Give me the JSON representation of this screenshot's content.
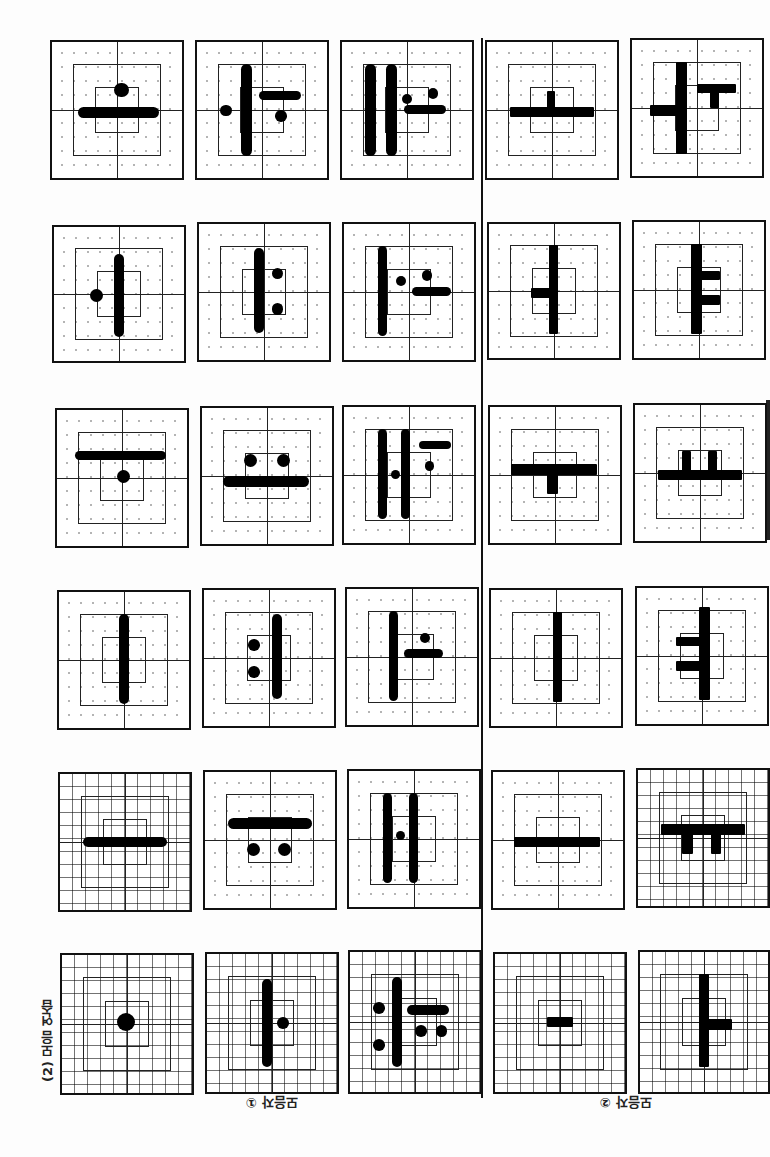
{
  "page": {
    "orientation": "upside-down scan",
    "section_label": "(2) 모음 연습",
    "group_labels": [
      "모음자 ①",
      "모음자 ②"
    ]
  },
  "cells": [
    {
      "id": "r1c1",
      "x": 50,
      "y": 40,
      "w": 134,
      "h": 140,
      "grid": "dotted",
      "glyph": "ㅗ (inverted)",
      "shapes": [
        {
          "t": "bar",
          "x": 20,
          "y": 48,
          "w": 62,
          "h": 8
        },
        {
          "t": "dot",
          "x": 48,
          "y": 30,
          "d": 11
        }
      ]
    },
    {
      "id": "r1c2",
      "x": 195,
      "y": 40,
      "w": 134,
      "h": 140,
      "grid": "dotted",
      "glyph": "ㅕ (inverted)",
      "shapes": [
        {
          "t": "bar",
          "x": 34,
          "y": 16,
          "w": 8,
          "h": 68
        },
        {
          "t": "bar",
          "x": 48,
          "y": 36,
          "w": 32,
          "h": 7
        },
        {
          "t": "dot",
          "x": 18,
          "y": 46,
          "d": 9
        },
        {
          "t": "dot",
          "x": 60,
          "y": 50,
          "d": 9
        }
      ]
    },
    {
      "id": "r1c3",
      "x": 340,
      "y": 40,
      "w": 134,
      "h": 140,
      "grid": "dotted",
      "glyph": "ㅒ (inverted)",
      "shapes": [
        {
          "t": "bar",
          "x": 18,
          "y": 16,
          "w": 8,
          "h": 68
        },
        {
          "t": "bar",
          "x": 34,
          "y": 16,
          "w": 8,
          "h": 68
        },
        {
          "t": "bar",
          "x": 48,
          "y": 46,
          "w": 32,
          "h": 7
        },
        {
          "t": "dot",
          "x": 46,
          "y": 38,
          "d": 8
        },
        {
          "t": "dot",
          "x": 66,
          "y": 34,
          "d": 8
        }
      ]
    },
    {
      "id": "r1c4",
      "x": 485,
      "y": 40,
      "w": 134,
      "h": 140,
      "grid": "dotted",
      "glyph": "ㅗ (print, inverted)",
      "shapes": [
        {
          "t": "sq",
          "x": 18,
          "y": 48,
          "w": 64,
          "h": 7
        },
        {
          "t": "sq",
          "x": 46,
          "y": 36,
          "w": 6,
          "h": 14
        }
      ]
    },
    {
      "id": "r1c5",
      "x": 630,
      "y": 38,
      "w": 134,
      "h": 140,
      "grid": "dotted",
      "glyph": "ㅝ (print, inverted)",
      "shapes": [
        {
          "t": "sq",
          "x": 34,
          "y": 16,
          "w": 8,
          "h": 68
        },
        {
          "t": "sq",
          "x": 14,
          "y": 48,
          "w": 22,
          "h": 8
        },
        {
          "t": "sq",
          "x": 50,
          "y": 32,
          "w": 30,
          "h": 7
        },
        {
          "t": "sq",
          "x": 60,
          "y": 36,
          "w": 7,
          "h": 14
        }
      ]
    },
    {
      "id": "r2c1",
      "x": 52,
      "y": 225,
      "w": 134,
      "h": 138,
      "grid": "dotted",
      "glyph": "ㅓ (inverted)",
      "shapes": [
        {
          "t": "bar",
          "x": 46,
          "y": 20,
          "w": 8,
          "h": 62
        },
        {
          "t": "dot",
          "x": 28,
          "y": 46,
          "d": 10
        }
      ]
    },
    {
      "id": "r2c2",
      "x": 197,
      "y": 222,
      "w": 134,
      "h": 140,
      "grid": "dotted",
      "glyph": "ㅕ (inverted)",
      "shapes": [
        {
          "t": "bar",
          "x": 42,
          "y": 18,
          "w": 8,
          "h": 62
        },
        {
          "t": "dot",
          "x": 56,
          "y": 32,
          "d": 9
        },
        {
          "t": "dot",
          "x": 56,
          "y": 58,
          "d": 9
        }
      ]
    },
    {
      "id": "r2c3",
      "x": 342,
      "y": 222,
      "w": 134,
      "h": 140,
      "grid": "dotted",
      "glyph": "ㅓ+ㅗ (inverted)",
      "shapes": [
        {
          "t": "bar",
          "x": 26,
          "y": 16,
          "w": 7,
          "h": 66
        },
        {
          "t": "dot",
          "x": 40,
          "y": 38,
          "d": 8
        },
        {
          "t": "bar",
          "x": 52,
          "y": 46,
          "w": 30,
          "h": 7
        },
        {
          "t": "dot",
          "x": 60,
          "y": 34,
          "d": 8
        }
      ]
    },
    {
      "id": "r2c4",
      "x": 487,
      "y": 222,
      "w": 134,
      "h": 138,
      "grid": "dotted",
      "glyph": "ㅓ (print, inverted)",
      "shapes": [
        {
          "t": "sq",
          "x": 46,
          "y": 16,
          "w": 7,
          "h": 66
        },
        {
          "t": "sq",
          "x": 32,
          "y": 48,
          "w": 16,
          "h": 7
        }
      ]
    },
    {
      "id": "r2c5",
      "x": 632,
      "y": 220,
      "w": 134,
      "h": 140,
      "grid": "dotted",
      "glyph": "ㅕ (print, inverted)",
      "shapes": [
        {
          "t": "sq",
          "x": 44,
          "y": 16,
          "w": 8,
          "h": 66
        },
        {
          "t": "sq",
          "x": 50,
          "y": 36,
          "w": 16,
          "h": 7
        },
        {
          "t": "sq",
          "x": 50,
          "y": 54,
          "w": 16,
          "h": 7
        }
      ]
    },
    {
      "id": "r3c1",
      "x": 55,
      "y": 408,
      "w": 134,
      "h": 140,
      "grid": "dotted",
      "glyph": "ㅜ (inverted)",
      "shapes": [
        {
          "t": "bar",
          "x": 14,
          "y": 30,
          "w": 70,
          "h": 7
        },
        {
          "t": "dot",
          "x": 46,
          "y": 44,
          "d": 10
        }
      ]
    },
    {
      "id": "r3c2",
      "x": 200,
      "y": 406,
      "w": 134,
      "h": 140,
      "grid": "dotted",
      "glyph": "ㅠ (inverted)",
      "shapes": [
        {
          "t": "bar",
          "x": 16,
          "y": 50,
          "w": 66,
          "h": 8
        },
        {
          "t": "dot",
          "x": 32,
          "y": 34,
          "d": 10
        },
        {
          "t": "dot",
          "x": 58,
          "y": 34,
          "d": 10
        }
      ]
    },
    {
      "id": "r3c3",
      "x": 342,
      "y": 405,
      "w": 134,
      "h": 140,
      "grid": "dotted",
      "glyph": "ㅖ (inverted)",
      "shapes": [
        {
          "t": "bar",
          "x": 26,
          "y": 16,
          "w": 7,
          "h": 66
        },
        {
          "t": "bar",
          "x": 44,
          "y": 16,
          "w": 7,
          "h": 66
        },
        {
          "t": "bar",
          "x": 58,
          "y": 25,
          "w": 24,
          "h": 6
        },
        {
          "t": "dot",
          "x": 36,
          "y": 46,
          "d": 7
        },
        {
          "t": "dot",
          "x": 62,
          "y": 40,
          "d": 7
        }
      ]
    },
    {
      "id": "r3c4",
      "x": 488,
      "y": 405,
      "w": 134,
      "h": 140,
      "grid": "dotted",
      "glyph": "ㅜ (print, inverted)",
      "shapes": [
        {
          "t": "sq",
          "x": 16,
          "y": 42,
          "w": 66,
          "h": 8
        },
        {
          "t": "sq",
          "x": 44,
          "y": 48,
          "w": 8,
          "h": 16
        }
      ]
    },
    {
      "id": "r3c5",
      "x": 633,
      "y": 403,
      "w": 134,
      "h": 140,
      "grid": "dotted",
      "glyph": "ㅛ (print, inverted)",
      "shapes": [
        {
          "t": "sq",
          "x": 18,
          "y": 48,
          "w": 64,
          "h": 7
        },
        {
          "t": "sq",
          "x": 36,
          "y": 34,
          "w": 7,
          "h": 16
        },
        {
          "t": "sq",
          "x": 56,
          "y": 34,
          "w": 7,
          "h": 16
        }
      ]
    },
    {
      "id": "r4c1",
      "x": 57,
      "y": 590,
      "w": 134,
      "h": 140,
      "grid": "dotted",
      "glyph": "ㅣ (inverted)",
      "shapes": [
        {
          "t": "bar",
          "x": 46,
          "y": 16,
          "w": 8,
          "h": 66
        }
      ]
    },
    {
      "id": "r4c2",
      "x": 202,
      "y": 588,
      "w": 134,
      "h": 140,
      "grid": "dotted",
      "glyph": "ㅕ (inverted)",
      "shapes": [
        {
          "t": "bar",
          "x": 52,
          "y": 18,
          "w": 8,
          "h": 62
        },
        {
          "t": "dot",
          "x": 34,
          "y": 36,
          "d": 9
        },
        {
          "t": "dot",
          "x": 34,
          "y": 56,
          "d": 9
        }
      ]
    },
    {
      "id": "r4c3",
      "x": 345,
      "y": 587,
      "w": 134,
      "h": 140,
      "grid": "dotted",
      "glyph": "ㅛ/ㅓ (inverted)",
      "shapes": [
        {
          "t": "bar",
          "x": 32,
          "y": 16,
          "w": 7,
          "h": 66
        },
        {
          "t": "bar",
          "x": 44,
          "y": 44,
          "w": 30,
          "h": 7
        },
        {
          "t": "dot",
          "x": 56,
          "y": 32,
          "d": 8
        }
      ]
    },
    {
      "id": "r4c4",
      "x": 489,
      "y": 588,
      "w": 134,
      "h": 140,
      "grid": "dotted",
      "glyph": "ㅣ (print, inverted)",
      "shapes": [
        {
          "t": "sq",
          "x": 48,
          "y": 16,
          "w": 7,
          "h": 66
        }
      ]
    },
    {
      "id": "r4c5",
      "x": 635,
      "y": 586,
      "w": 134,
      "h": 140,
      "grid": "dotted",
      "glyph": "ㅕ (print, inverted)",
      "shapes": [
        {
          "t": "sq",
          "x": 48,
          "y": 14,
          "w": 8,
          "h": 68
        },
        {
          "t": "sq",
          "x": 30,
          "y": 36,
          "w": 20,
          "h": 7
        },
        {
          "t": "sq",
          "x": 30,
          "y": 54,
          "w": 20,
          "h": 7
        }
      ]
    },
    {
      "id": "r5c1",
      "x": 58,
      "y": 772,
      "w": 134,
      "h": 140,
      "grid": "fine",
      "glyph": "ㅡ (inverted)",
      "shapes": [
        {
          "t": "bar",
          "x": 18,
          "y": 46,
          "w": 64,
          "h": 8
        }
      ]
    },
    {
      "id": "r5c2",
      "x": 203,
      "y": 770,
      "w": 134,
      "h": 140,
      "grid": "dotted",
      "glyph": "ㅠ (inverted)",
      "shapes": [
        {
          "t": "bar",
          "x": 18,
          "y": 34,
          "w": 64,
          "h": 8
        },
        {
          "t": "dot",
          "x": 32,
          "y": 52,
          "d": 10
        },
        {
          "t": "dot",
          "x": 56,
          "y": 52,
          "d": 10
        }
      ]
    },
    {
      "id": "r5c3",
      "x": 347,
      "y": 769,
      "w": 134,
      "h": 140,
      "grid": "dotted",
      "glyph": "ㅒ (inverted)",
      "shapes": [
        {
          "t": "bar",
          "x": 26,
          "y": 16,
          "w": 7,
          "h": 66
        },
        {
          "t": "bar",
          "x": 46,
          "y": 16,
          "w": 7,
          "h": 66
        },
        {
          "t": "dot",
          "x": 36,
          "y": 44,
          "d": 7
        }
      ]
    },
    {
      "id": "r5c4",
      "x": 491,
      "y": 770,
      "w": 134,
      "h": 140,
      "grid": "dotted",
      "glyph": "ㅡ (print, inverted)",
      "shapes": [
        {
          "t": "sq",
          "x": 16,
          "y": 48,
          "w": 66,
          "h": 7
        }
      ]
    },
    {
      "id": "r5c5",
      "x": 636,
      "y": 768,
      "w": 134,
      "h": 140,
      "grid": "fine",
      "glyph": "ㅠ (print, inverted)",
      "shapes": [
        {
          "t": "sq",
          "x": 18,
          "y": 40,
          "w": 64,
          "h": 8
        },
        {
          "t": "sq",
          "x": 34,
          "y": 44,
          "w": 8,
          "h": 18
        },
        {
          "t": "sq",
          "x": 56,
          "y": 44,
          "w": 8,
          "h": 18
        }
      ]
    },
    {
      "id": "r6c1",
      "x": 60,
      "y": 953,
      "w": 134,
      "h": 142,
      "grid": "fine",
      "glyph": "· (dot)",
      "shapes": [
        {
          "t": "dot",
          "x": 42,
          "y": 42,
          "d": 14
        }
      ]
    },
    {
      "id": "r6c2",
      "x": 205,
      "y": 952,
      "w": 134,
      "h": 142,
      "grid": "fine",
      "glyph": "ㅕ (inverted)",
      "shapes": [
        {
          "t": "bar",
          "x": 42,
          "y": 18,
          "w": 8,
          "h": 64
        },
        {
          "t": "dot",
          "x": 54,
          "y": 46,
          "d": 9
        }
      ]
    },
    {
      "id": "r6c3",
      "x": 348,
      "y": 950,
      "w": 134,
      "h": 144,
      "grid": "fine",
      "glyph": "ㅞ (inverted)",
      "shapes": [
        {
          "t": "bar",
          "x": 32,
          "y": 18,
          "w": 8,
          "h": 64
        },
        {
          "t": "bar",
          "x": 44,
          "y": 38,
          "w": 32,
          "h": 7
        },
        {
          "t": "dot",
          "x": 18,
          "y": 36,
          "d": 9
        },
        {
          "t": "dot",
          "x": 18,
          "y": 62,
          "d": 9
        },
        {
          "t": "dot",
          "x": 50,
          "y": 52,
          "d": 9
        },
        {
          "t": "dot",
          "x": 66,
          "y": 52,
          "d": 9
        }
      ]
    },
    {
      "id": "r6c4",
      "x": 493,
      "y": 952,
      "w": 134,
      "h": 142,
      "grid": "fine",
      "glyph": "ㅡ short (print)",
      "shapes": [
        {
          "t": "sq",
          "x": 40,
          "y": 46,
          "w": 20,
          "h": 7
        }
      ]
    },
    {
      "id": "r6c5",
      "x": 638,
      "y": 950,
      "w": 132,
      "h": 144,
      "grid": "fine",
      "glyph": "ㅓ (print, inverted)",
      "shapes": [
        {
          "t": "sq",
          "x": 46,
          "y": 16,
          "w": 8,
          "h": 66
        },
        {
          "t": "sq",
          "x": 52,
          "y": 48,
          "w": 20,
          "h": 8
        }
      ]
    }
  ]
}
